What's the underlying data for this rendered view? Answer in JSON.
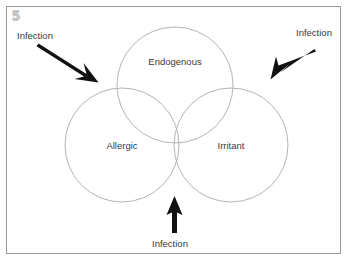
{
  "figure": {
    "number_marker": "5",
    "border_color": "#9a9a9a",
    "circle_stroke_color": "#b4b4b4",
    "arrow_color": "#111111",
    "text_color": "#3a3a3a",
    "background_color": "#ffffff"
  },
  "diagram": {
    "type": "venn-3-circle",
    "sets": [
      {
        "id": "endogenous",
        "label": "Endogenous",
        "position": "top"
      },
      {
        "id": "allergic",
        "label": "Allergic",
        "position": "bottom-left"
      },
      {
        "id": "irritant",
        "label": "Irritant",
        "position": "bottom-right"
      }
    ],
    "callouts": [
      {
        "id": "infection-topleft",
        "label": "Infection",
        "arrow_direction": "down-right"
      },
      {
        "id": "infection-topright",
        "label": "Infection",
        "arrow_direction": "down-left"
      },
      {
        "id": "infection-bottom",
        "label": "Infection",
        "arrow_direction": "up"
      }
    ]
  }
}
